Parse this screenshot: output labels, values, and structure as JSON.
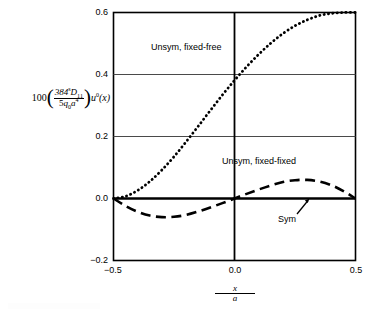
{
  "chart_data": {
    "type": "line",
    "title": "",
    "subtitle": "",
    "xlabel": "x/a",
    "ylabel": "100 (384^s D_11 / 5 q_0 a^4) u^0(x)",
    "xlim": [
      -0.5,
      0.5
    ],
    "ylim": [
      -0.2,
      0.6
    ],
    "xticks": [
      -0.5,
      0.0,
      0.5
    ],
    "xticklabels": [
      "−0.5",
      "0.0",
      "0.5"
    ],
    "yticks": [
      -0.2,
      0.0,
      0.2,
      0.4,
      0.6
    ],
    "yticklabels": [
      "−0.2",
      "0.0",
      "0.2",
      "0.4",
      "0.6"
    ],
    "grid": "horizontal gridlines at 0.2 and 0.4; thick zero line at 0.0; vertical axis line at x=0",
    "legend_position": "inline annotations",
    "series": [
      {
        "name": "Unsym, fixed-free",
        "style": "dotted",
        "x": [
          -0.5,
          -0.45,
          -0.4,
          -0.35,
          -0.3,
          -0.25,
          -0.2,
          -0.15,
          -0.1,
          -0.05,
          0.0,
          0.05,
          0.1,
          0.15,
          0.2,
          0.25,
          0.3,
          0.35,
          0.4,
          0.45,
          0.5
        ],
        "values": [
          0.0,
          0.007,
          0.026,
          0.055,
          0.092,
          0.135,
          0.183,
          0.233,
          0.284,
          0.334,
          0.381,
          0.425,
          0.465,
          0.501,
          0.532,
          0.557,
          0.576,
          0.59,
          0.597,
          0.6,
          0.6
        ]
      },
      {
        "name": "Unsym, fixed-fixed",
        "style": "dashed",
        "x": [
          -0.5,
          -0.45,
          -0.4,
          -0.35,
          -0.3,
          -0.25,
          -0.2,
          -0.15,
          -0.1,
          -0.05,
          0.0,
          0.05,
          0.1,
          0.15,
          0.2,
          0.25,
          0.3,
          0.35,
          0.4,
          0.45,
          0.5
        ],
        "values": [
          0.0,
          -0.024,
          -0.043,
          -0.055,
          -0.06,
          -0.059,
          -0.053,
          -0.042,
          -0.029,
          -0.015,
          0.0,
          0.015,
          0.029,
          0.042,
          0.053,
          0.059,
          0.06,
          0.055,
          0.043,
          0.024,
          0.0
        ]
      },
      {
        "name": "Sym",
        "style": "solid-thick",
        "x": [
          -0.5,
          0.5
        ],
        "values": [
          0.0,
          0.0
        ]
      }
    ],
    "annotations": [
      {
        "text": "Unsym, fixed-free",
        "x": -0.18,
        "y": 0.47
      },
      {
        "text": "Unsym, fixed-fixed",
        "x": 0.12,
        "y": 0.135
      },
      {
        "text": "Sym",
        "x": 0.3,
        "y": -0.055,
        "arrow_to": {
          "x": 0.345,
          "y": 0.0
        }
      }
    ]
  },
  "ylabel_parts": {
    "lead": "100",
    "numerator_base": "384",
    "numerator_sup": "s",
    "numerator_sym": "D",
    "numerator_sub": "11",
    "denominator_coef": "5",
    "denominator_q": "q",
    "denominator_q_sub": "0",
    "denominator_a": "a",
    "denominator_a_sup": "4",
    "tail_u": "u",
    "tail_u_sup": "0",
    "tail_arg": "(x)"
  },
  "xlabel_parts": {
    "numerator": "x",
    "denominator": "a"
  },
  "yticks": {
    "t0": "0.6",
    "t1": "0.4",
    "t2": "0.2",
    "t3": "0.0",
    "t4": "−0.2"
  },
  "xticks": {
    "t0": "−0.5",
    "t1": "0.0",
    "t2": "0.5"
  },
  "annotations": {
    "fixed_free": "Unsym, fixed-free",
    "fixed_fixed": "Unsym, fixed-fixed",
    "sym": "Sym"
  },
  "colors": {
    "ink": "#000000",
    "background": "#ffffff",
    "gridline": "#4a4a4a"
  }
}
